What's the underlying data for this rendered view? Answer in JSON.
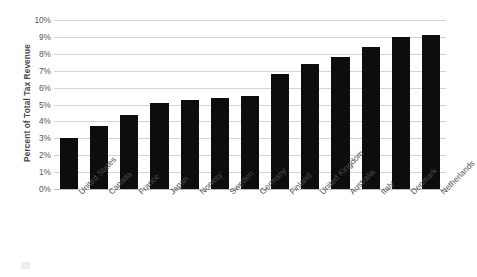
{
  "chart_data": {
    "type": "bar",
    "title": "",
    "xlabel": "",
    "ylabel": "Percent of Total Tax Revenue",
    "ylim": [
      0,
      10
    ],
    "ytick_step": 1,
    "ytick_labels": [
      "10%",
      "9%",
      "8%",
      "7%",
      "6%",
      "5%",
      "4%",
      "3%",
      "2%",
      "1%",
      "0%"
    ],
    "ytick_values": [
      10,
      9,
      8,
      7,
      6,
      5,
      4,
      3,
      2,
      1,
      0
    ],
    "grid": true,
    "legend": false,
    "bar_color": "#0d0d0d",
    "gridline_color": "#d4d4d4",
    "categories": [
      "United States",
      "Canada",
      "France",
      "Japan",
      "Norway",
      "Sweden",
      "Germany",
      "Finland",
      "United Kingdom",
      "Australia",
      "Italy",
      "Denmark",
      "Netherlands"
    ],
    "values": [
      3.0,
      3.7,
      4.4,
      5.1,
      5.25,
      5.4,
      5.5,
      6.8,
      7.4,
      7.8,
      8.4,
      9.0,
      9.1
    ],
    "value_unit": "%"
  }
}
